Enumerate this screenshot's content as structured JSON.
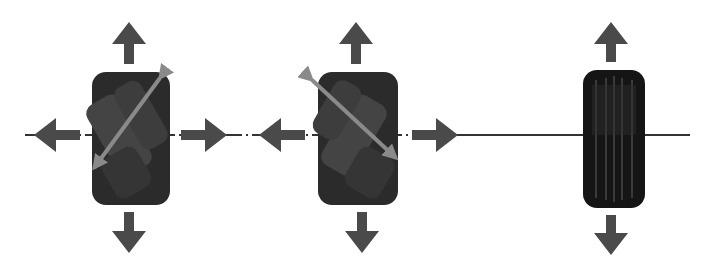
{
  "diagram": {
    "colors": {
      "arrow": "#4a4a4a",
      "roller_arrow": "#8a8a8a",
      "wheel": "#2a2a2a",
      "axis_line": "#333333",
      "background": "#ffffff"
    },
    "wheels": [
      {
        "type": "mecanum",
        "roller_diagonal": "bottom-left to top-right",
        "arrows": [
          "up",
          "down",
          "left",
          "right"
        ]
      },
      {
        "type": "mecanum",
        "roller_diagonal": "top-left to bottom-right",
        "arrows": [
          "up",
          "down",
          "left",
          "right"
        ]
      },
      {
        "type": "standard",
        "arrows": [
          "up",
          "down"
        ]
      }
    ]
  }
}
